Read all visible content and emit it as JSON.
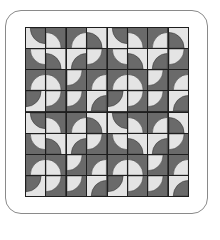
{
  "colors": {
    "light": "#e4e4e4",
    "dark": "#6a6a6a",
    "grid": "#1e1e1e",
    "frame": "#8a8a8a"
  },
  "quilt": {
    "rows": 8,
    "cols": 8,
    "pattern_name": "drunkards-path",
    "block": [
      [
        [
          "light",
          "TR"
        ],
        [
          "dark",
          "BL"
        ],
        [
          "dark",
          "BR"
        ],
        [
          "light",
          "BL"
        ]
      ],
      [
        [
          "dark",
          "TR"
        ],
        [
          "light",
          "BL"
        ],
        [
          "light",
          "BR"
        ],
        [
          "dark",
          "TL"
        ]
      ],
      [
        [
          "dark",
          "BR"
        ],
        [
          "dark",
          "BL"
        ],
        [
          "dark",
          "TL"
        ],
        [
          "dark",
          "BR"
        ]
      ],
      [
        [
          "light",
          "TL"
        ],
        [
          "dark",
          "TL"
        ],
        [
          "dark",
          "TL"
        ],
        [
          "light",
          "BR"
        ]
      ]
    ]
  }
}
